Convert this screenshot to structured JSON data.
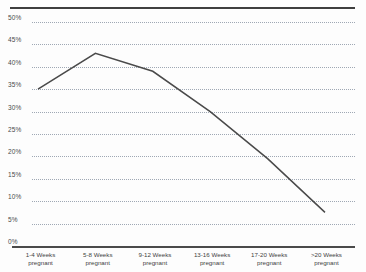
{
  "chart_data": {
    "type": "line",
    "title": "",
    "subtitle": "",
    "xlabel": "",
    "ylabel": "",
    "categories": [
      "1-4 Weeks pregnant",
      "5-8 Weeks pregnant",
      "9-12 Weeks pregnant",
      "13-16 Weeks pregnant",
      "17-20 Weeks pregnant",
      ">20 Weeks pregnant"
    ],
    "category_lines": [
      [
        "1-4 Weeks",
        "pregnant"
      ],
      [
        "5-8 Weeks",
        "pregnant"
      ],
      [
        "9-12 Weeks",
        "pregnant"
      ],
      [
        "13-16 Weeks",
        "pregnant"
      ],
      [
        "17-20 Weeks",
        "pregnant"
      ],
      [
        ">20 Weeks",
        "pregnant"
      ]
    ],
    "values": [
      35,
      43,
      39,
      30,
      19.5,
      7.5
    ],
    "series": [
      {
        "name": "",
        "values": [
          35,
          43,
          39,
          30,
          19.5,
          7.5
        ]
      }
    ],
    "ylim": [
      0,
      50
    ],
    "ytick_values": [
      50,
      45,
      40,
      35,
      30,
      25,
      20,
      15,
      10,
      5,
      0
    ],
    "ytick_labels": [
      "50%",
      "45%",
      "40%",
      "35%",
      "30%",
      "25%",
      "20%",
      "15%",
      "10%",
      "5%",
      "0%"
    ],
    "grid": true,
    "grid_style": "dotted-horizontal",
    "legend": false,
    "legend_position": "none",
    "line_color": "#4a4a4a",
    "grid_color": "#8f9aa8",
    "axis_color": "#4a4a4a",
    "background_color": "#fdfdfd",
    "markers": false
  },
  "decorations": {
    "top_rule_color": "#3f3f3f"
  }
}
